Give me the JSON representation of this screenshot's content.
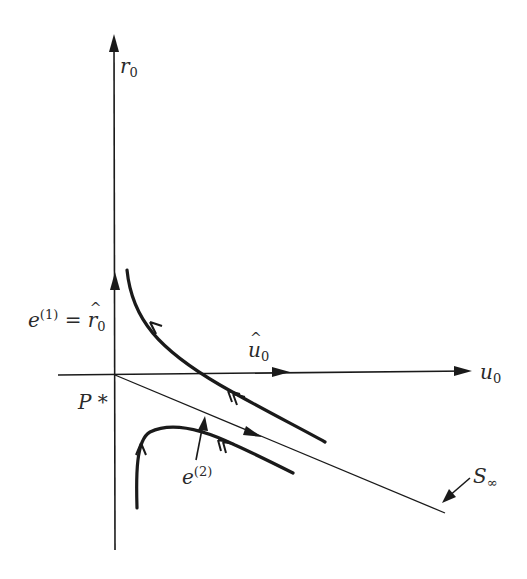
{
  "figure": {
    "axes": {
      "vertical_label": {
        "base": "r",
        "sub": "0"
      },
      "horizontal_label": {
        "base": "u",
        "sub": "0"
      }
    },
    "labels": {
      "e1": {
        "base": "e",
        "sup": "(1)",
        "eq": "=",
        "rhs_base": "r",
        "rhs_sub": "0"
      },
      "u_hat": {
        "base": "u",
        "sub": "0"
      },
      "origin": {
        "text": "P *"
      },
      "e2": {
        "base": "e",
        "sup": "(2)"
      },
      "s_inf": {
        "base": "S",
        "sub": "∞"
      }
    },
    "colors": {
      "ink": "#1a1a1a",
      "background": "#ffffff"
    }
  }
}
